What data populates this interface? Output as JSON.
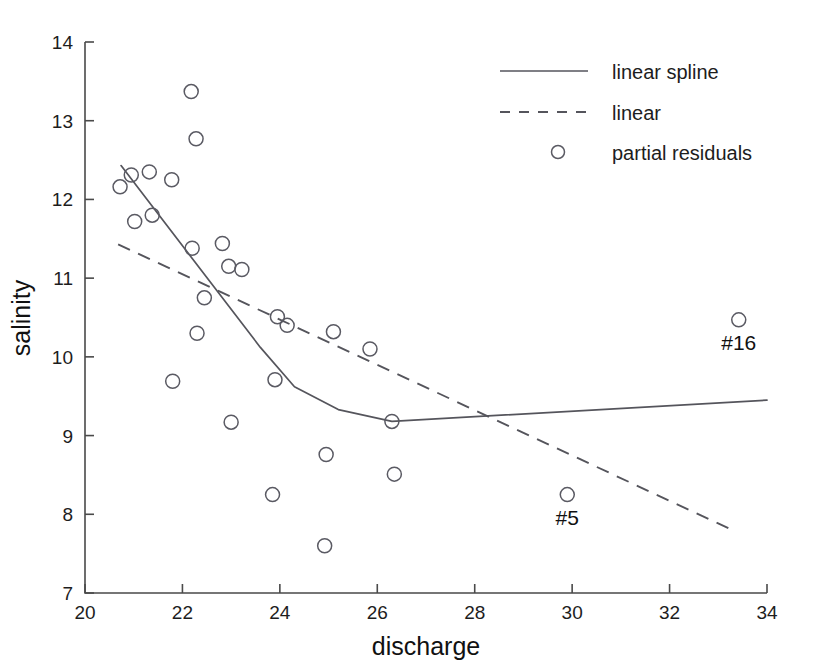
{
  "chart_data": {
    "type": "scatter",
    "title": "",
    "xlabel": "discharge",
    "ylabel": "salinity",
    "xlim": [
      20,
      34
    ],
    "ylim": [
      7,
      14
    ],
    "xticks": [
      20,
      22,
      24,
      26,
      28,
      30,
      32,
      34
    ],
    "yticks": [
      7,
      8,
      9,
      10,
      11,
      12,
      13,
      14
    ],
    "grid": false,
    "legend_position": "top-right",
    "legend": [
      {
        "label": "linear spline",
        "style": "solid-line"
      },
      {
        "label": "linear",
        "style": "dashed-line"
      },
      {
        "label": "partial residuals",
        "style": "open-circle"
      }
    ],
    "series": [
      {
        "name": "partial residuals",
        "type": "scatter",
        "marker": "open-circle",
        "points": [
          {
            "x": 20.72,
            "y": 12.16
          },
          {
            "x": 20.95,
            "y": 12.31
          },
          {
            "x": 21.02,
            "y": 11.72
          },
          {
            "x": 21.32,
            "y": 12.35
          },
          {
            "x": 21.38,
            "y": 11.8
          },
          {
            "x": 21.78,
            "y": 12.25
          },
          {
            "x": 21.8,
            "y": 9.69
          },
          {
            "x": 22.18,
            "y": 13.37
          },
          {
            "x": 22.2,
            "y": 11.38
          },
          {
            "x": 22.28,
            "y": 12.77
          },
          {
            "x": 22.3,
            "y": 10.3
          },
          {
            "x": 22.45,
            "y": 10.75
          },
          {
            "x": 22.82,
            "y": 11.44
          },
          {
            "x": 22.95,
            "y": 11.15
          },
          {
            "x": 23.0,
            "y": 9.17
          },
          {
            "x": 23.22,
            "y": 11.11
          },
          {
            "x": 23.85,
            "y": 8.25
          },
          {
            "x": 23.9,
            "y": 9.71
          },
          {
            "x": 23.95,
            "y": 10.51
          },
          {
            "x": 24.15,
            "y": 10.4
          },
          {
            "x": 24.92,
            "y": 7.6
          },
          {
            "x": 24.95,
            "y": 8.76
          },
          {
            "x": 25.1,
            "y": 10.32
          },
          {
            "x": 25.85,
            "y": 10.1
          },
          {
            "x": 26.3,
            "y": 9.18
          },
          {
            "x": 26.35,
            "y": 8.51
          },
          {
            "x": 29.9,
            "y": 8.25
          },
          {
            "x": 33.42,
            "y": 10.47
          }
        ]
      },
      {
        "name": "linear spline",
        "type": "line",
        "style": "solid",
        "points": [
          {
            "x": 20.74,
            "y": 12.43
          },
          {
            "x": 23.6,
            "y": 10.12
          },
          {
            "x": 24.3,
            "y": 9.62
          },
          {
            "x": 25.2,
            "y": 9.33
          },
          {
            "x": 26.3,
            "y": 9.18
          },
          {
            "x": 34.0,
            "y": 9.45
          }
        ]
      },
      {
        "name": "linear",
        "type": "line",
        "style": "dashed",
        "points": [
          {
            "x": 20.68,
            "y": 11.43
          },
          {
            "x": 33.22,
            "y": 7.82
          }
        ]
      }
    ],
    "annotations": [
      {
        "label": "#5",
        "x": 29.9,
        "y": 8.25,
        "placement": "below"
      },
      {
        "label": "#16",
        "x": 33.42,
        "y": 10.47,
        "placement": "below"
      }
    ]
  },
  "axes": {
    "x_title": "discharge",
    "y_title": "salinity",
    "x_tick_labels": [
      "20",
      "22",
      "24",
      "26",
      "28",
      "30",
      "32",
      "34"
    ],
    "y_tick_labels": [
      "7",
      "8",
      "9",
      "10",
      "11",
      "12",
      "13",
      "14"
    ]
  },
  "legend": {
    "entries": [
      "linear spline",
      "linear",
      "partial residuals"
    ]
  },
  "annotations": {
    "labels": [
      "#5",
      "#16"
    ]
  },
  "colors": {
    "background": "#ffffff",
    "axis": "#4a4a4a",
    "curve": "#55555c",
    "marker": "#5a5a63",
    "text": "#1d1d1d"
  }
}
